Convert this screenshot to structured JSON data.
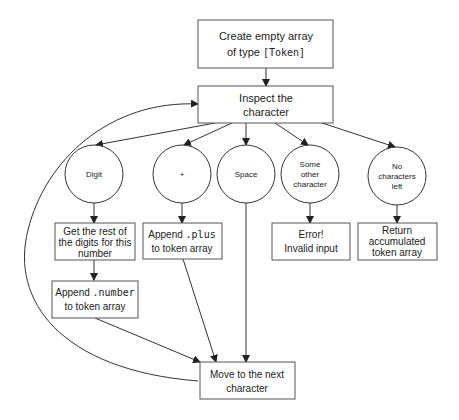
{
  "nodes": {
    "create": {
      "line1": "Create empty array",
      "line2_prefix": "of type ",
      "line2_code": "[Token]"
    },
    "inspect": {
      "line1": "Inspect the",
      "line2": "character"
    },
    "digit": {
      "label": "Digit"
    },
    "plus": {
      "label": "+"
    },
    "space": {
      "label": "Space"
    },
    "other": {
      "line1": "Some",
      "line2": "other",
      "line3": "character"
    },
    "none": {
      "line1": "No",
      "line2": "characters",
      "line3": "left"
    },
    "rest_digits": {
      "line1": "Get the rest of",
      "line2": "the digits for this",
      "line3": "number"
    },
    "append_plus": {
      "line1_prefix": "Append ",
      "line1_code": ".plus",
      "line2": "to token array"
    },
    "error": {
      "line1": "Error!",
      "line2": "Invalid input"
    },
    "return": {
      "line1": "Return",
      "line2": "accumulated",
      "line3": "token array"
    },
    "append_number": {
      "line1_prefix": "Append ",
      "line1_code": ".number",
      "line2": "to token array"
    },
    "move": {
      "line1": "Move to the next",
      "line2": "character"
    }
  },
  "colors": {
    "stroke": "#333333",
    "background": "#ffffff",
    "text": "#222222"
  }
}
